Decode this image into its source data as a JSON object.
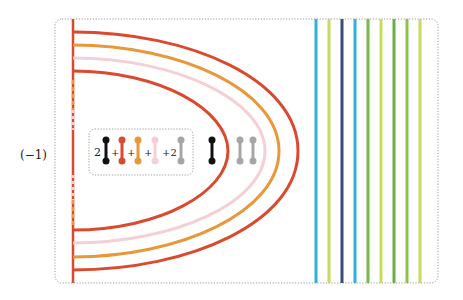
{
  "diagram": {
    "prefix_label": "(−1)",
    "colors": {
      "red": "#d94a2e",
      "orange": "#e8973a",
      "pink": "#f4cfd6",
      "black": "#111111",
      "gray": "#a6a6a6",
      "cyan": "#2fb2d6",
      "lime": "#c5dc5e",
      "navy": "#3c4a80",
      "green": "#78b84c",
      "frame": "#9a9a9a"
    },
    "arcs": [
      {
        "color": "red",
        "top_y": 32,
        "bottom_y": 270,
        "peak_x": 298
      },
      {
        "color": "orange",
        "top_y": 45,
        "bottom_y": 257,
        "peak_x": 279
      },
      {
        "color": "pink",
        "top_y": 58,
        "bottom_y": 243,
        "peak_x": 265
      },
      {
        "color": "red",
        "top_y": 71,
        "bottom_y": 230,
        "peak_x": 228
      }
    ],
    "vertical_lines": [
      {
        "x": 316,
        "color": "cyan"
      },
      {
        "x": 329,
        "color": "lime"
      },
      {
        "x": 342,
        "color": "navy"
      },
      {
        "x": 355,
        "color": "cyan"
      },
      {
        "x": 368,
        "color": "green"
      },
      {
        "x": 381,
        "color": "lime"
      },
      {
        "x": 394,
        "color": "green"
      },
      {
        "x": 407,
        "color": "green"
      },
      {
        "x": 420,
        "color": "lime"
      }
    ],
    "legend": {
      "coef_first": "2",
      "plus_1": "+",
      "plus_2": "+",
      "plus_3": "+",
      "coef_last": "+2",
      "dumbbells": [
        {
          "x": 106,
          "color": "black"
        },
        {
          "x": 122,
          "color": "red"
        },
        {
          "x": 138,
          "color": "orange"
        },
        {
          "x": 155,
          "color": "pink"
        },
        {
          "x": 181,
          "color": "gray"
        }
      ]
    },
    "free_dumbbells": [
      {
        "x": 212,
        "color": "black"
      },
      {
        "x": 240,
        "color": "gray"
      },
      {
        "x": 253,
        "color": "gray"
      }
    ]
  }
}
